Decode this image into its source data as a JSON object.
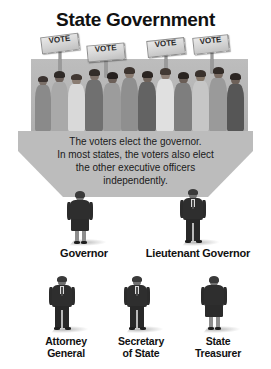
{
  "title": "State Government",
  "crowd": {
    "name": "voters-crowd-photo",
    "signs": [
      {
        "label": "VOTE"
      },
      {
        "label": "VOTE"
      },
      {
        "label": "VOTE"
      },
      {
        "label": "VOTE"
      }
    ]
  },
  "arrow": {
    "name": "voters-elect-arrow",
    "lines": [
      "The voters elect the governor.",
      "In most states, the voters also elect",
      "the other executive officers",
      "independently."
    ]
  },
  "officials": {
    "row1": [
      {
        "label": "Governor",
        "label_line1": "Governor",
        "label_line2": "",
        "figure": "female"
      },
      {
        "label": "Lieutenant Governor",
        "label_line1": "Lieutenant Governor",
        "label_line2": "",
        "figure": "male"
      }
    ],
    "row2": [
      {
        "label": "Attorney General",
        "label_line1": "Attorney",
        "label_line2": "General",
        "figure": "male"
      },
      {
        "label": "Secretary of State",
        "label_line1": "Secretary",
        "label_line2": "of State",
        "figure": "male"
      },
      {
        "label": "State Treasurer",
        "label_line1": "State",
        "label_line2": "Treasurer",
        "figure": "female"
      }
    ]
  },
  "colors": {
    "background": "#ffffff",
    "panel_gray": "#b7b7b7",
    "arrow_gray": "#b9b9b9",
    "text_dark": "#111111",
    "suit_dark": "#2b2b2b"
  }
}
